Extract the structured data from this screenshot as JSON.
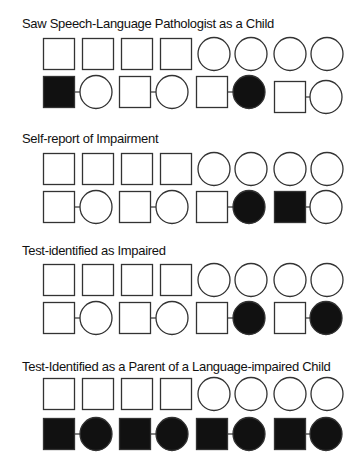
{
  "panels": [
    {
      "title": "Saw Speech-Language Pathologist as a Child",
      "grandparents": [
        {
          "sex": "male",
          "affected": false
        },
        {
          "sex": "male",
          "affected": false
        },
        {
          "sex": "male",
          "affected": false
        },
        {
          "sex": "male",
          "affected": false
        },
        {
          "sex": "female",
          "affected": false
        },
        {
          "sex": "female",
          "affected": false
        },
        {
          "sex": "female",
          "affected": false
        },
        {
          "sex": "female",
          "affected": false
        }
      ],
      "couples": [
        {
          "father_affected": true,
          "mother_affected": false
        },
        {
          "father_affected": false,
          "mother_affected": false
        },
        {
          "father_affected": false,
          "mother_affected": true
        },
        {
          "father_affected": false,
          "mother_affected": false
        }
      ]
    },
    {
      "title": "Self-report of Impairment",
      "grandparents": [
        {
          "sex": "male",
          "affected": false
        },
        {
          "sex": "male",
          "affected": false
        },
        {
          "sex": "male",
          "affected": false
        },
        {
          "sex": "male",
          "affected": false
        },
        {
          "sex": "female",
          "affected": false
        },
        {
          "sex": "female",
          "affected": false
        },
        {
          "sex": "female",
          "affected": false
        },
        {
          "sex": "female",
          "affected": false
        }
      ],
      "couples": [
        {
          "father_affected": false,
          "mother_affected": false
        },
        {
          "father_affected": false,
          "mother_affected": false
        },
        {
          "father_affected": false,
          "mother_affected": true
        },
        {
          "father_affected": true,
          "mother_affected": false
        }
      ]
    },
    {
      "title": "Test-identified as Impaired",
      "grandparents": [
        {
          "sex": "male",
          "affected": false
        },
        {
          "sex": "male",
          "affected": false
        },
        {
          "sex": "male",
          "affected": false
        },
        {
          "sex": "male",
          "affected": false
        },
        {
          "sex": "female",
          "affected": false
        },
        {
          "sex": "female",
          "affected": false
        },
        {
          "sex": "female",
          "affected": false
        },
        {
          "sex": "female",
          "affected": false
        }
      ],
      "couples": [
        {
          "father_affected": false,
          "mother_affected": false
        },
        {
          "father_affected": false,
          "mother_affected": false
        },
        {
          "father_affected": false,
          "mother_affected": true
        },
        {
          "father_affected": false,
          "mother_affected": true
        }
      ]
    },
    {
      "title": "Test-Identified as a Parent of a Language-impaired Child",
      "grandparents": [
        {
          "sex": "male",
          "affected": false
        },
        {
          "sex": "male",
          "affected": false
        },
        {
          "sex": "male",
          "affected": false
        },
        {
          "sex": "male",
          "affected": false
        },
        {
          "sex": "female",
          "affected": false
        },
        {
          "sex": "female",
          "affected": false
        },
        {
          "sex": "female",
          "affected": false
        },
        {
          "sex": "female",
          "affected": false
        }
      ],
      "couples": [
        {
          "father_affected": true,
          "mother_affected": true
        },
        {
          "father_affected": true,
          "mother_affected": true
        },
        {
          "father_affected": true,
          "mother_affected": true
        },
        {
          "father_affected": true,
          "mother_affected": true
        }
      ]
    }
  ],
  "colors": {
    "stroke": "#333333",
    "affected": "#111111",
    "unaffected": "#ffffff"
  }
}
